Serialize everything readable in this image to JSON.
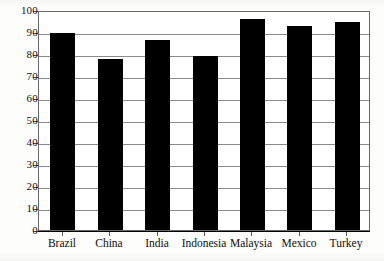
{
  "chart_data": {
    "type": "bar",
    "title": "",
    "subtitle": "",
    "xlabel": "",
    "ylabel": "",
    "categories": [
      "Brazil",
      "China",
      "India",
      "Indonesia",
      "Malaysia",
      "Mexico",
      "Turkey"
    ],
    "values": [
      89.5,
      77.5,
      86.5,
      79,
      96,
      92.5,
      94.5
    ],
    "ylim": [
      0,
      100
    ],
    "ytick_labels": [
      "100",
      "90",
      "80",
      "70",
      "60",
      "50",
      "40",
      "30",
      "20",
      "10",
      "0"
    ],
    "ytick_values": [
      100,
      90,
      80,
      70,
      60,
      50,
      40,
      30,
      20,
      10,
      0
    ],
    "ytick_step": 10,
    "grid": true,
    "grid_axis": "y",
    "legend": false,
    "legend_position": "none",
    "bar_color": "#000000",
    "grid_color": "#8a8a8a",
    "frame_color": "#6a6a6a",
    "axis_color": "#000000",
    "background_color": "#ffffff"
  }
}
